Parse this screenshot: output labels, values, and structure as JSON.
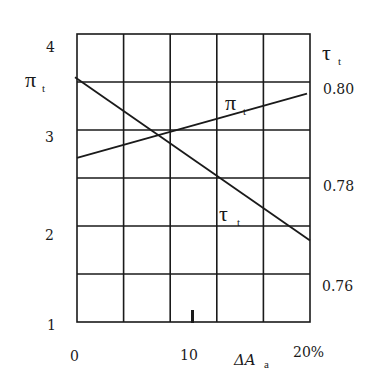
{
  "chart_data": {
    "type": "line",
    "title": "",
    "xlabel": "ΔA_a",
    "x_unit": "%",
    "xlim": [
      0,
      20
    ],
    "x_ticks": [
      "0",
      "10",
      "20%"
    ],
    "grid": true,
    "grid_columns": 5,
    "grid_rows": 6,
    "y_left": {
      "label": "π_t",
      "label_main": "π",
      "label_sub": "t",
      "ylim": [
        1,
        4
      ],
      "ticks": [
        "1",
        "2",
        "3",
        "4"
      ]
    },
    "y_right": {
      "label": "τ_t",
      "label_main": "τ",
      "label_sub": "t",
      "ylim": [
        0.755,
        0.815
      ],
      "ticks": [
        "0.76",
        "0.78",
        "0.80"
      ]
    },
    "series": [
      {
        "name": "π_t",
        "label_main": "π",
        "label_sub": "t",
        "axis": "left",
        "x": [
          0,
          20
        ],
        "values": [
          2.71,
          3.38
        ]
      },
      {
        "name": "τ_t",
        "label_main": "τ",
        "label_sub": "t",
        "axis": "right",
        "x": [
          0,
          20
        ],
        "values": [
          0.801,
          0.767
        ]
      }
    ],
    "annotations": [
      {
        "text": "π_t",
        "near_series": "π_t"
      },
      {
        "text": "τ_t",
        "near_series": "τ_t"
      }
    ]
  },
  "labels": {
    "left_axis_main": "π",
    "left_axis_sub": "t",
    "right_axis_main": "τ",
    "right_axis_sub": "t",
    "left_ticks": [
      "4",
      "3",
      "2",
      "1"
    ],
    "right_ticks": [
      "0.80",
      "0.78",
      "0.76"
    ],
    "x_tick_0": "0",
    "x_tick_10": "10",
    "x_tick_20": "20%",
    "x_axis_main": "ΔA",
    "x_axis_sub": "a",
    "series_pi_main": "π",
    "series_pi_sub": "t",
    "series_tau_main": "τ",
    "series_tau_sub": "t"
  }
}
